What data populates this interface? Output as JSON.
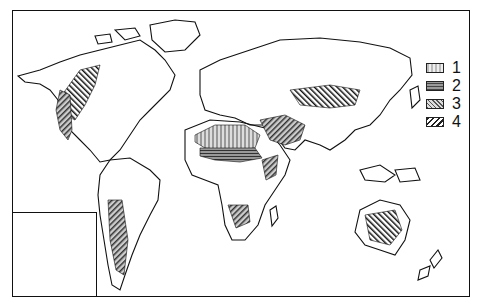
{
  "map": {
    "type": "world-map",
    "description": "Black-and-white world map with hatched regions indicating four zone categories",
    "colors": {
      "outline": "#111111",
      "background": "#ffffff"
    },
    "inset": {
      "region": "Europe"
    }
  },
  "legend": {
    "items": [
      {
        "label": "1",
        "pattern": "light-dotted-gray"
      },
      {
        "label": "2",
        "pattern": "dark-horizontal-hatch"
      },
      {
        "label": "3",
        "pattern": "mixed-cross-hatch"
      },
      {
        "label": "4",
        "pattern": "diagonal-stripes"
      }
    ]
  }
}
